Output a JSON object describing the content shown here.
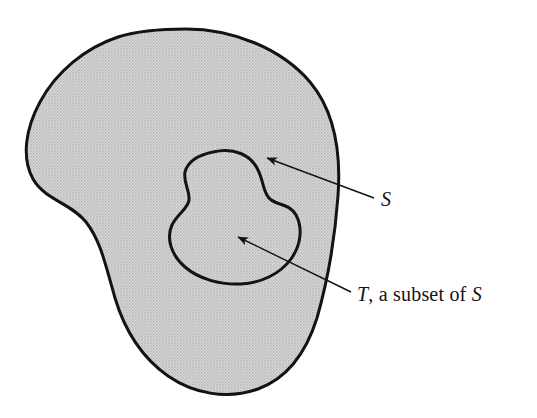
{
  "figure": {
    "type": "set-venn-diagram",
    "background_color": "#ffffff",
    "outline_color": "#131313",
    "fill_color": "#c9c9c9",
    "fill_pattern": "halftone-dots",
    "outline_width_px": 3
  },
  "labels": {
    "outer_set": {
      "name": "S",
      "italic_parts": [
        "S"
      ],
      "x": 381,
      "y": 188
    },
    "inner_set": {
      "leading_symbol": "T",
      "middle_text": ", a subset of ",
      "trailing_symbol": "S",
      "full_text": "T, a subset of S",
      "x": 357,
      "y": 283
    }
  },
  "annotations": [
    {
      "name": "arrow-to-S",
      "label": "S",
      "tail_x": 374,
      "tail_y": 198,
      "tip_x": 263,
      "tip_y": 156,
      "target": "outer shaded region"
    },
    {
      "name": "arrow-to-T",
      "label": "T, a subset of S",
      "tail_x": 351,
      "tail_y": 292,
      "tip_x": 233,
      "tip_y": 235,
      "target": "inner blob region"
    }
  ],
  "shapes": {
    "outer_region": {
      "name": "S",
      "bounds": {
        "left": 28,
        "top": 29,
        "right": 338,
        "bottom": 394
      }
    },
    "inner_region": {
      "name": "T",
      "bounds": {
        "left": 168,
        "top": 151,
        "right": 300,
        "bottom": 284
      }
    }
  }
}
